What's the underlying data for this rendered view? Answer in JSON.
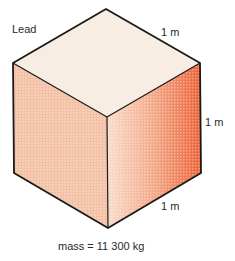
{
  "diagram": {
    "material_label": "Lead",
    "dimensions": {
      "top_edge": "1 m",
      "right_edge": "1 m",
      "bottom_edge": "1 m"
    },
    "mass_label": "mass = 11 300 kg"
  },
  "colors": {
    "top_face": "#f8ede2",
    "left_face": "#f6c9b1",
    "right_face_light": "#f8d8c6",
    "right_face_dark": "#ee6a3e",
    "edge": "#1a1a1a"
  }
}
